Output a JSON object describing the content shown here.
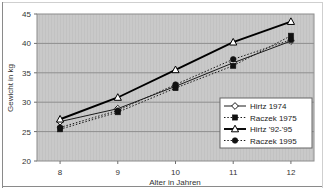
{
  "chart_data": {
    "type": "line",
    "title": "",
    "xlabel": "Alter in Jahren",
    "ylabel": "Gewicht in kg",
    "x": [
      8,
      9,
      10,
      11,
      12
    ],
    "xtick_labels": [
      "8",
      "9",
      "10",
      "11",
      "12"
    ],
    "ytick_labels": [
      "20",
      "25",
      "30",
      "35",
      "40",
      "45"
    ],
    "yticks": [
      20,
      25,
      30,
      35,
      40,
      45
    ],
    "xlim": [
      7.6,
      12.4
    ],
    "ylim": [
      20,
      45
    ],
    "grid": true,
    "grid_axis": "y",
    "legend_position": "inside-bottom-right",
    "plot_background": "#c9c9c9",
    "series": [
      {
        "name": "Hirtz 1974",
        "values": [
          26.7,
          28.9,
          32.7,
          36.7,
          40.4
        ],
        "marker": "open-diamond",
        "line_style": "solid",
        "color": "#1a1a1a"
      },
      {
        "name": "Raczek 1975",
        "values": [
          25.4,
          28.3,
          32.4,
          36.2,
          41.3
        ],
        "marker": "filled-square",
        "line_style": "dotted",
        "color": "#1a1a1a"
      },
      {
        "name": "Hirtz '92-'95",
        "values": [
          27.1,
          30.8,
          35.5,
          40.2,
          43.7
        ],
        "marker": "open-triangle",
        "line_style": "solid-thick",
        "color": "#000000"
      },
      {
        "name": "Raczek 1995",
        "values": [
          25.7,
          28.6,
          33.0,
          37.3,
          40.6
        ],
        "marker": "filled-circle",
        "line_style": "dotted",
        "color": "#1a1a1a"
      }
    ]
  },
  "legend": {
    "items": [
      {
        "label": "Hirtz 1974"
      },
      {
        "label": "Raczek 1975"
      },
      {
        "label": "Hirtz  '92-'95"
      },
      {
        "label": "Raczek 1995"
      }
    ]
  },
  "axes": {
    "y_title": "Gewicht in kg",
    "x_title": "Alter in Jahren",
    "y_labels": [
      "45",
      "40",
      "35",
      "30",
      "25",
      "20"
    ],
    "x_labels": [
      "8",
      "9",
      "10",
      "11",
      "12"
    ]
  }
}
